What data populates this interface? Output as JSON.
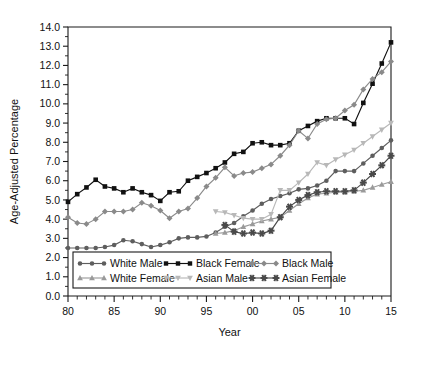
{
  "chart_data": {
    "type": "line",
    "title": "",
    "xlabel": "Year",
    "ylabel": "Age-Adjusted Percentage",
    "xlim": [
      80,
      115
    ],
    "ylim": [
      0.0,
      14.0
    ],
    "grid": false,
    "legend_position": "bottom-inside",
    "x": [
      80,
      81,
      82,
      83,
      84,
      85,
      86,
      87,
      88,
      89,
      90,
      91,
      92,
      93,
      94,
      95,
      96,
      97,
      98,
      99,
      100,
      101,
      102,
      103,
      104,
      105,
      106,
      107,
      108,
      109,
      110,
      111,
      112,
      113,
      114,
      115
    ],
    "x_tick_values": [
      80,
      85,
      90,
      95,
      100,
      105,
      110,
      115
    ],
    "x_tick_labels": [
      "80",
      "85",
      "90",
      "95",
      "00",
      "05",
      "10",
      "15"
    ],
    "y_tick_values": [
      0.0,
      1.0,
      2.0,
      3.0,
      4.0,
      5.0,
      6.0,
      7.0,
      8.0,
      9.0,
      10.0,
      11.0,
      12.0,
      13.0,
      14.0
    ],
    "y_tick_labels": [
      "0.0",
      "1.0",
      "2.0",
      "3.0",
      "4.0",
      "5.0",
      "6.0",
      "7.0",
      "8.0",
      "9.0",
      "10.0",
      "11.0",
      "12.0",
      "13.0",
      "14.0"
    ],
    "series": [
      {
        "name": "White Male",
        "color": "#5e5e5e",
        "marker": "circle",
        "x": [
          80,
          81,
          82,
          83,
          84,
          85,
          86,
          87,
          88,
          89,
          90,
          91,
          92,
          93,
          94,
          95,
          96,
          97,
          98,
          99,
          100,
          101,
          102,
          103,
          104,
          105,
          106,
          107,
          108,
          109,
          110,
          111,
          112,
          113,
          114,
          115
        ],
        "values": [
          2.5,
          2.5,
          2.5,
          2.5,
          2.55,
          2.65,
          2.9,
          2.85,
          2.7,
          2.55,
          2.65,
          2.8,
          3.0,
          3.05,
          3.05,
          3.1,
          3.3,
          3.6,
          3.8,
          4.15,
          4.45,
          4.8,
          5.05,
          5.2,
          5.35,
          5.55,
          5.6,
          5.75,
          6.0,
          6.5,
          6.5,
          6.5,
          6.9,
          7.3,
          7.7,
          8.1
        ]
      },
      {
        "name": "Black Female",
        "color": "#111111",
        "marker": "square",
        "x": [
          80,
          81,
          82,
          83,
          84,
          85,
          86,
          87,
          88,
          89,
          90,
          91,
          92,
          93,
          94,
          95,
          96,
          97,
          98,
          99,
          100,
          101,
          102,
          103,
          104,
          105,
          106,
          107,
          108,
          109,
          110,
          111,
          112,
          113,
          114,
          115
        ],
        "values": [
          4.9,
          5.3,
          5.65,
          6.05,
          5.7,
          5.6,
          5.4,
          5.6,
          5.4,
          5.25,
          4.95,
          5.4,
          5.45,
          6.0,
          6.2,
          6.4,
          6.65,
          6.95,
          7.4,
          7.5,
          7.95,
          8.0,
          7.85,
          7.85,
          7.95,
          8.6,
          8.85,
          9.1,
          9.25,
          9.25,
          9.25,
          8.95,
          10.05,
          11.05,
          12.1,
          13.2
        ]
      },
      {
        "name": "Black Male",
        "color": "#8a8a8a",
        "marker": "diamond",
        "x": [
          80,
          81,
          82,
          83,
          84,
          85,
          86,
          87,
          88,
          89,
          90,
          91,
          92,
          93,
          94,
          95,
          96,
          97,
          98,
          99,
          100,
          101,
          102,
          103,
          104,
          105,
          106,
          107,
          108,
          109,
          110,
          111,
          112,
          113,
          114,
          115
        ],
        "values": [
          4.1,
          3.8,
          3.75,
          4.0,
          4.4,
          4.4,
          4.4,
          4.5,
          4.85,
          4.7,
          4.45,
          4.05,
          4.4,
          4.55,
          5.1,
          5.7,
          6.15,
          6.7,
          6.25,
          6.4,
          6.45,
          6.65,
          6.85,
          7.3,
          7.85,
          8.6,
          8.2,
          8.95,
          9.2,
          9.25,
          9.65,
          9.95,
          10.75,
          11.3,
          11.65,
          12.2
        ]
      },
      {
        "name": "White Female",
        "color": "#9a9a9a",
        "marker": "triangle-up",
        "x": [
          96,
          97,
          98,
          99,
          100,
          101,
          102,
          103,
          104,
          105,
          106,
          107,
          108,
          109,
          110,
          111,
          112,
          113,
          114,
          115
        ],
        "values": [
          3.25,
          3.3,
          3.4,
          3.6,
          3.75,
          3.9,
          4.0,
          4.1,
          4.45,
          4.8,
          5.1,
          5.3,
          5.35,
          5.4,
          5.4,
          5.45,
          5.5,
          5.65,
          5.8,
          5.95
        ]
      },
      {
        "name": "Asian Male",
        "color": "#b8b8b8",
        "marker": "triangle-down",
        "x": [
          96,
          97,
          98,
          99,
          100,
          101,
          102,
          103,
          104,
          105,
          106,
          107,
          108,
          109,
          110,
          111,
          112,
          113,
          114,
          115
        ],
        "values": [
          4.4,
          4.35,
          4.2,
          4.05,
          4.0,
          4.0,
          4.25,
          5.5,
          5.5,
          5.9,
          6.35,
          6.95,
          6.8,
          7.1,
          7.35,
          7.6,
          7.95,
          8.3,
          8.65,
          9.0
        ]
      },
      {
        "name": "Asian Female",
        "color": "#4a4a4a",
        "marker": "star",
        "x": [
          97,
          98,
          99,
          100,
          101,
          102,
          103,
          104,
          105,
          106,
          107,
          108,
          109,
          110,
          111,
          112,
          113,
          114,
          115
        ],
        "values": [
          3.7,
          3.35,
          3.25,
          3.3,
          3.25,
          3.4,
          4.1,
          4.65,
          5.0,
          5.25,
          5.4,
          5.45,
          5.45,
          5.45,
          5.5,
          5.9,
          6.35,
          6.8,
          7.3
        ]
      }
    ]
  },
  "legend": {
    "entries": [
      {
        "label": "White Male"
      },
      {
        "label": "White Female"
      },
      {
        "label": "Black Male"
      },
      {
        "label": "Black Female"
      },
      {
        "label": "Asian Male"
      },
      {
        "label": "Asian Female"
      }
    ]
  }
}
